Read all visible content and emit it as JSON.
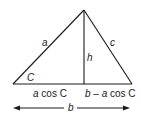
{
  "diagram": {
    "type": "triangle-law-of-cosines",
    "vertices": {
      "left": [
        13,
        84
      ],
      "apex": [
        84,
        10
      ],
      "right": [
        132,
        84
      ],
      "foot": [
        84,
        84
      ]
    },
    "labels": {
      "side_a": "a",
      "side_c": "c",
      "height": "h",
      "angle": "C",
      "left_segment_var": "a",
      "left_segment_rest": " cos C",
      "right_segment_b": "b",
      "right_segment_dash": " – ",
      "right_segment_var": "a",
      "right_segment_rest": " cos C",
      "base": "b"
    },
    "colors": {
      "stroke": "#1a1a1a",
      "background": "#ffffff"
    }
  }
}
